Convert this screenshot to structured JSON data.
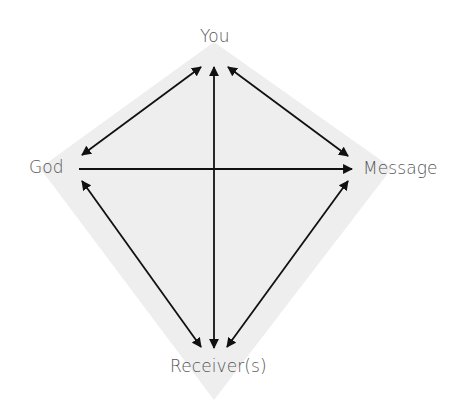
{
  "diagram": {
    "type": "kite-relationship-diagram",
    "background_color": "#ffffff",
    "kite_fill": "#eeeeee",
    "arrow_color": "#111111",
    "label_color": "#555555",
    "nodes": {
      "top": "You",
      "left": "God",
      "right": "Message",
      "bottom": "Receiver(s)"
    },
    "edges": [
      {
        "from": "God",
        "to": "You",
        "direction": "bidirectional"
      },
      {
        "from": "You",
        "to": "Message",
        "direction": "bidirectional"
      },
      {
        "from": "God",
        "to": "Receiver(s)",
        "direction": "bidirectional"
      },
      {
        "from": "Message",
        "to": "Receiver(s)",
        "direction": "bidirectional"
      },
      {
        "from": "You",
        "to": "Receiver(s)",
        "direction": "bidirectional"
      },
      {
        "from": "God",
        "to": "Message",
        "direction": "one-way"
      }
    ]
  }
}
